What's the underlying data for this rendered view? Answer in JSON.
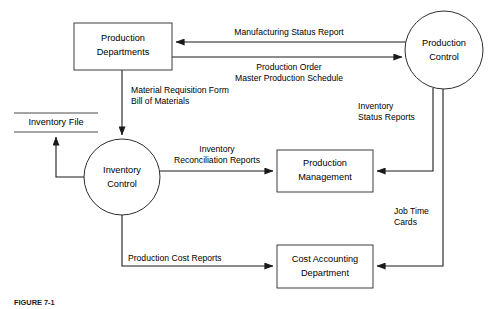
{
  "diagram": {
    "type": "data-flow-diagram",
    "caption": "FIGURE 7-1",
    "processes": [
      {
        "id": "inventory-control",
        "label_line1": "Inventory",
        "label_line2": "Control",
        "shape": "circle",
        "cx": 122,
        "cy": 177,
        "r": 38
      },
      {
        "id": "production-control",
        "label_line1": "Production",
        "label_line2": "Control",
        "shape": "circle",
        "cx": 444,
        "cy": 50,
        "r": 39
      }
    ],
    "entities": [
      {
        "id": "production-departments",
        "label_line1": "Production",
        "label_line2": "Departments",
        "shape": "rectangle",
        "x": 74,
        "y": 23,
        "w": 98,
        "h": 47
      },
      {
        "id": "production-management",
        "label_line1": "Production",
        "label_line2": "Management",
        "shape": "rectangle",
        "x": 277,
        "y": 150,
        "w": 96,
        "h": 42
      },
      {
        "id": "cost-accounting-department",
        "label_line1": "Cost Accounting",
        "label_line2": "Department",
        "shape": "rectangle",
        "x": 277,
        "y": 245,
        "w": 96,
        "h": 43
      }
    ],
    "data_stores": [
      {
        "id": "inventory-file",
        "label": "Inventory File",
        "shape": "open-rectangle",
        "x": 14,
        "y": 113,
        "w": 84,
        "h": 19
      }
    ],
    "flows": [
      {
        "id": "manufacturing-status-report",
        "label_line1": "Manufacturing Status Report",
        "label_line2": "",
        "from": "production-control",
        "to": "production-departments",
        "direction": "left"
      },
      {
        "id": "production-order-master-schedule",
        "label_line1": "Production Order",
        "label_line2": "Master Production Schedule",
        "from": "production-departments",
        "to": "production-control",
        "direction": "right"
      },
      {
        "id": "material-requisition-bill-of-materials",
        "label_line1": "Material Requisition Form",
        "label_line2": "Bill of Materials",
        "from": "production-departments",
        "to": "inventory-control",
        "direction": "down"
      },
      {
        "id": "inventory-file-update",
        "label_line1": "",
        "label_line2": "",
        "from": "inventory-control",
        "to": "inventory-file",
        "direction": "up"
      },
      {
        "id": "inventory-reconciliation-reports",
        "label_line1": "Inventory",
        "label_line2": "Reconciliation Reports",
        "from": "inventory-control",
        "to": "production-management",
        "direction": "right"
      },
      {
        "id": "inventory-status-reports",
        "label_line1": "Inventory",
        "label_line2": "Status Reports",
        "from": "production-control",
        "to": "production-management",
        "direction": "left"
      },
      {
        "id": "job-time-cards",
        "label_line1": "Job Time",
        "label_line2": "Cards",
        "from": "production-control",
        "to": "cost-accounting-department",
        "direction": "left"
      },
      {
        "id": "production-cost-reports",
        "label_line1": "Production Cost Reports",
        "label_line2": "",
        "from": "inventory-control",
        "to": "cost-accounting-department",
        "direction": "right"
      }
    ]
  }
}
